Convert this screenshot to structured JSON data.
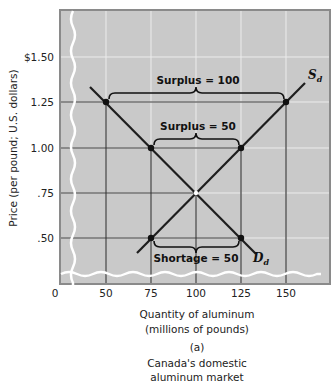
{
  "chart_data": {
    "type": "line",
    "panel_label": "(a)",
    "xlabel": "Quantity of aluminum",
    "xlabel_units": "(millions of pounds)",
    "ylabel": "Price (per pound; U.S. dollars)",
    "x_ticks": [
      "0",
      "50",
      "75",
      "100",
      "125",
      "150"
    ],
    "y_ticks": [
      "$1.50",
      "1.25",
      "1.00",
      ".75",
      ".50"
    ],
    "xlim": [
      0,
      170
    ],
    "ylim": [
      0,
      1.75
    ],
    "grid": true,
    "axis_breaks": true,
    "series": [
      {
        "name": "S_d",
        "label": "S",
        "subscript": "d",
        "description": "Domestic supply",
        "points": [
          [
            75,
            0.5
          ],
          [
            100,
            0.75
          ],
          [
            125,
            1.0
          ],
          [
            150,
            1.25
          ]
        ]
      },
      {
        "name": "D_d",
        "label": "D",
        "subscript": "d",
        "description": "Domestic demand",
        "points": [
          [
            50,
            1.25
          ],
          [
            75,
            1.0
          ],
          [
            100,
            0.75
          ],
          [
            125,
            0.5
          ]
        ]
      }
    ],
    "equilibrium": {
      "quantity": 100,
      "price": 0.75
    },
    "annotations": [
      {
        "text": "Surplus = 100",
        "price": 1.25,
        "from_q": 50,
        "to_q": 150
      },
      {
        "text": "Surplus = 50",
        "price": 1.0,
        "from_q": 75,
        "to_q": 125
      },
      {
        "text": "Shortage = 50",
        "price": 0.5,
        "from_q": 75,
        "to_q": 125
      }
    ],
    "colors": {
      "plot_background": "#c9c9c9",
      "grid_major": "#3a3a3a",
      "grid_minor": "#ebebeb",
      "curves": "#1e1e1e",
      "border": "#8a8a8a"
    }
  }
}
